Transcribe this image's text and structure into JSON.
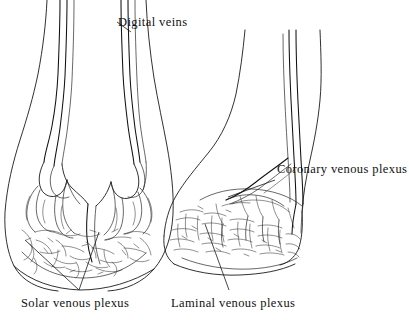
{
  "figure": {
    "type": "anatomical-line-drawing",
    "background_color": "#ffffff",
    "ink_color": "#1a1a1a",
    "views": [
      {
        "name": "dorsal-view",
        "position": "left",
        "description": "Front (dorsal) view of the hoof showing the dense venous plexus network"
      },
      {
        "name": "lateral-view",
        "position": "right",
        "description": "Side (lateral/oblique) view of the hoof showing coronary and laminal plexus"
      }
    ]
  },
  "labels": {
    "digital_veins": "Digital veins",
    "coronary_venous_plexus": "Coronary venous plexus",
    "solar_venous_plexus": "Solar venous plexus",
    "laminal_venous_plexus": "Laminal venous plexus"
  }
}
